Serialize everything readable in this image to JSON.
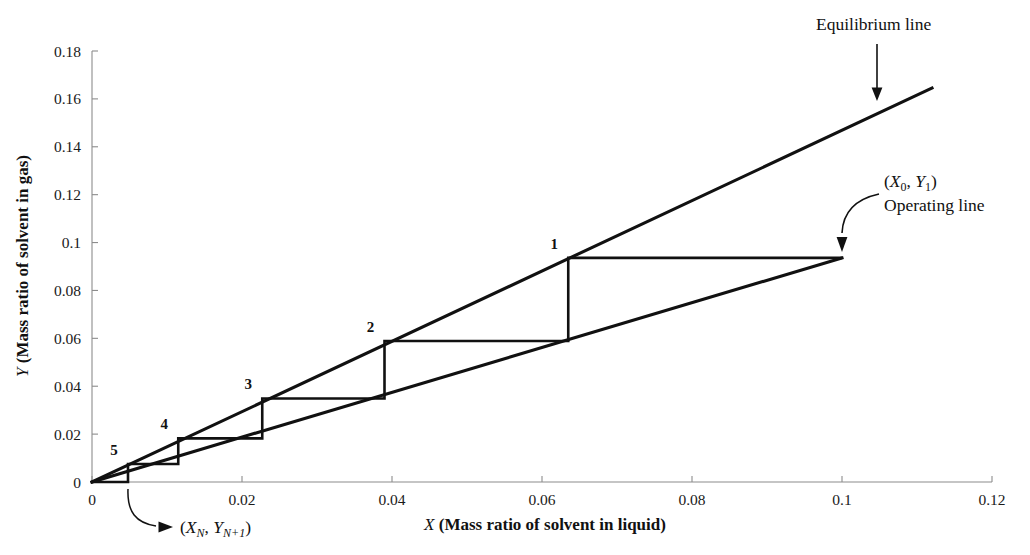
{
  "chart_data": {
    "type": "line",
    "title": "",
    "xlabel": "X (Mass ratio of solvent in liquid)",
    "ylabel": "Y (Mass ratio of solvent in gas)",
    "xlim": [
      0,
      0.12
    ],
    "ylim": [
      0,
      0.18
    ],
    "xticks": [
      "0",
      "0.02",
      "0.04",
      "0.06",
      "0.08",
      "0.1",
      "0.12"
    ],
    "xtick_values": [
      0,
      0.02,
      0.04,
      0.06,
      0.08,
      0.1,
      0.12
    ],
    "yticks": [
      "0",
      "0.02",
      "0.04",
      "0.06",
      "0.08",
      "0.1",
      "0.12",
      "0.14",
      "0.16",
      "0.18"
    ],
    "ytick_values": [
      0,
      0.02,
      0.04,
      0.06,
      0.08,
      0.1,
      0.12,
      0.14,
      0.16,
      0.18
    ],
    "grid": false,
    "legend": "none",
    "series": [
      {
        "name": "Equilibrium line",
        "kind": "line",
        "slope": 1.47,
        "x": [
          0,
          0.112
        ],
        "y": [
          0,
          0.1645
        ]
      },
      {
        "name": "Operating line",
        "kind": "line",
        "slope": 0.936,
        "x": [
          0,
          0.1
        ],
        "y": [
          0,
          0.0936
        ]
      },
      {
        "name": "Stage construction staircase",
        "kind": "staircase",
        "x": [
          0.1,
          0.0635,
          0.0635,
          0.039,
          0.039,
          0.0227,
          0.0227,
          0.0115,
          0.0115,
          0.0048,
          0.0048,
          0.0
        ],
        "y": [
          0.0936,
          0.0936,
          0.0589,
          0.0589,
          0.0349,
          0.0349,
          0.0182,
          0.0182,
          0.0075,
          0.0075,
          0.0,
          0.0
        ]
      }
    ],
    "stage_points": [
      {
        "label": "1",
        "x": 0.0635,
        "y": 0.0936
      },
      {
        "label": "2",
        "x": 0.039,
        "y": 0.0589
      },
      {
        "label": "3",
        "x": 0.0227,
        "y": 0.0349
      },
      {
        "label": "4",
        "x": 0.0115,
        "y": 0.0182
      },
      {
        "label": "5",
        "x": 0.0048,
        "y": 0.0075
      }
    ],
    "annotations": [
      {
        "name": "equilibrium-line-annotation",
        "text": "Equilibrium line",
        "arrow": "straight-down",
        "target_x": 0.1053,
        "target_y": 0.1552
      },
      {
        "name": "operating-line-annotation",
        "text_line1_prefix": "(",
        "text_line1": "(X0, Y1)",
        "text_line2": "Operating line",
        "arrow": "curved-down-left",
        "target_x": 0.1,
        "target_y": 0.0936
      },
      {
        "name": "bottom-stage-annotation",
        "text": "(XN, YN+1)",
        "arrow": "curved-up-left",
        "target_x": 0.0048,
        "target_y": 0.0
      }
    ],
    "symbols": {
      "x0y1_base_x": "X",
      "x0y1_sub_0": "0",
      "x0y1_base_y": "Y",
      "x0y1_sub_1": "1",
      "xn_base_x": "X",
      "xn_sub_n": "N",
      "yn_base_y": "Y",
      "yn_sub_n1": "N+1",
      "open_paren": "(",
      "close_paren": ")",
      "comma": ","
    },
    "axis_title_parts": {
      "x_italic": "X",
      "x_rest": " (Mass ratio of solvent in liquid)",
      "y_italic": "Y",
      "y_rest": " (Mass ratio of solvent in gas)"
    },
    "colors": {
      "line": "#111111",
      "axis": "#8c8c8c",
      "text": "#1a1a1a",
      "background": "#ffffff"
    }
  }
}
